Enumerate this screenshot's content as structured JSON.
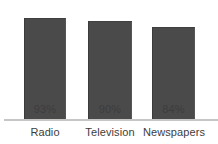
{
  "chart_data": {
    "type": "bar",
    "title": "",
    "subtitle": "",
    "xlabel": "",
    "ylabel": "",
    "categories": [
      "Radio",
      "Television",
      "Newspapers"
    ],
    "values": [
      93,
      90,
      84
    ],
    "value_labels": [
      "93%",
      "90%",
      "84%"
    ],
    "unit": "%",
    "ylim": [
      0,
      110
    ],
    "grid": false,
    "legend": false,
    "legend_position": "none",
    "orientation": "vertical",
    "annotations": []
  },
  "style": {
    "background": "#ffffff",
    "bar_color": "#4a4a4a",
    "bar_edge_color": "#3b3b3b",
    "axis_color": "#c8c6c4",
    "text_color": "#3d3d3d"
  },
  "geometry": {
    "bars": [
      {
        "left": 24,
        "width": 42,
        "height": 101
      },
      {
        "left": 88,
        "width": 44,
        "height": 98
      },
      {
        "left": 152,
        "width": 43,
        "height": 92
      }
    ],
    "label_slots": [
      {
        "left": 6,
        "width": 78
      },
      {
        "left": 71,
        "width": 78
      },
      {
        "left": 135,
        "width": 78
      }
    ]
  }
}
